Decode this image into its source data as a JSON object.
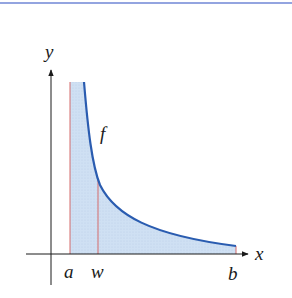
{
  "figure": {
    "colors": {
      "top_rule": "#6f86d6",
      "axis": "#1a1a1a",
      "curve": "#2a5cb0",
      "fill": "#cfe0f3",
      "vertical_lines": "#d46a6a"
    },
    "labels": {
      "y_axis": "y",
      "x_axis": "x",
      "curve": "f",
      "a": "a",
      "w": "w",
      "b": "b"
    }
  }
}
